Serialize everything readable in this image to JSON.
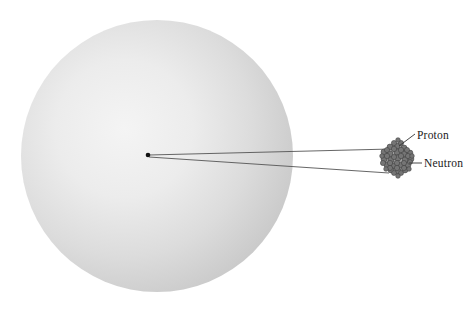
{
  "figure": {
    "type": "atom-diagram",
    "title": "",
    "background_color": "#ffffff"
  },
  "electron_cloud": {
    "name": "electron-cloud-sphere",
    "center_x": 157,
    "center_y": 156,
    "radius": 136,
    "fill_light": "#f2f2f2",
    "fill_mid": "#dedede",
    "fill_edge": "#c6c6c6"
  },
  "center_dot": {
    "name": "atom-center-dot",
    "x": 148,
    "y": 155,
    "radius": 2.2,
    "color": "#111111"
  },
  "pointer_lines": {
    "color": "#555555",
    "upper": {
      "x1": 149,
      "y1": 155,
      "x2": 391,
      "y2": 150
    },
    "lower": {
      "x1": 149,
      "y1": 156,
      "x2": 389,
      "y2": 172
    }
  },
  "nucleus": {
    "name": "nucleus-cluster",
    "center_x": 397,
    "center_y": 158,
    "radius": 15,
    "particle_color": "#6d6d6d",
    "particle_edge": "#3f3f3f",
    "particle_count": 46
  },
  "labels": {
    "proton": "Proton",
    "neutron": "Neutron"
  },
  "leaders": {
    "color": "#333333",
    "proton": {
      "x1": 399,
      "y1": 145,
      "x2": 415,
      "y2": 133
    },
    "neutron": {
      "x1": 409,
      "y1": 163,
      "x2": 422,
      "y2": 163
    }
  }
}
